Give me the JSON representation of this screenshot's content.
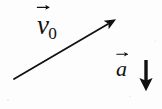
{
  "figure": {
    "kind": "physics-vector-diagram",
    "background_color": "#fdfdfd",
    "ink_color": "#111111",
    "width": 162,
    "height": 109
  },
  "labels": {
    "velocity": {
      "symbol": "v",
      "subscript": "0",
      "full_text": "v0",
      "accent": "vector-arrow-overset",
      "x": 37,
      "y": 12
    },
    "acceleration": {
      "symbol": "a",
      "subscript": "",
      "full_text": "a",
      "accent": "vector-arrow-overset",
      "x": 116,
      "y": 58
    }
  },
  "vectors": [
    {
      "name": "velocity-vector",
      "label": "v0",
      "style": "thin-line-solid-arrowhead",
      "tail": {
        "x": 14,
        "y": 79
      },
      "tip": {
        "x": 113,
        "y": 21
      },
      "direction": "up-right",
      "color": "#111111",
      "stroke_width": 1.8
    },
    {
      "name": "acceleration-vector",
      "label": "a",
      "style": "thick-shaft-solid-arrowhead",
      "tail": {
        "x": 146,
        "y": 60
      },
      "tip": {
        "x": 146,
        "y": 89
      },
      "direction": "down",
      "color": "#111111",
      "stroke_width": 3.4
    }
  ]
}
